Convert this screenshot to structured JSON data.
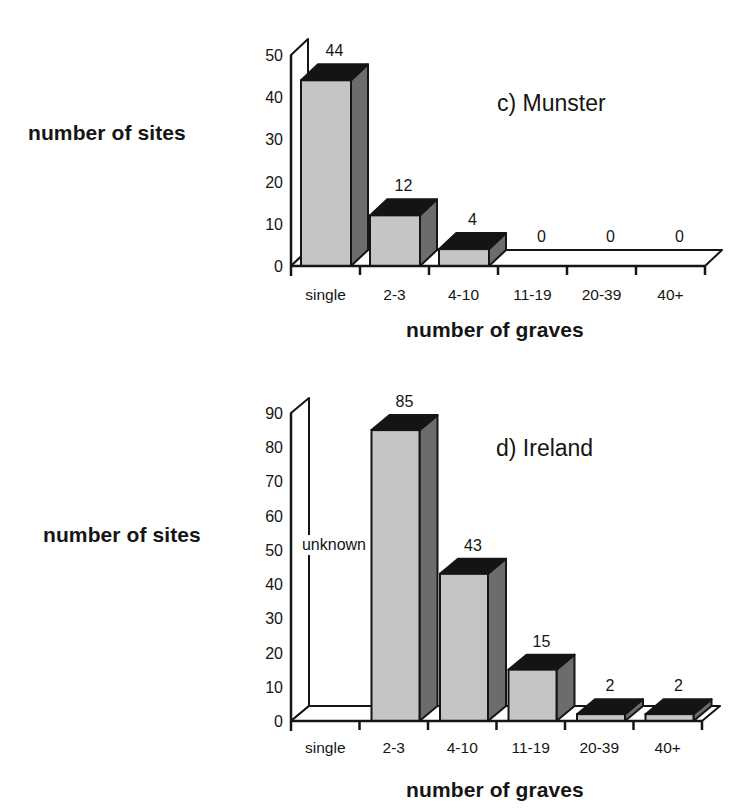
{
  "figure": {
    "panels": [
      {
        "id": "c",
        "title": "c) Munster",
        "ylabel": "number of sites",
        "xlabel": "number of graves"
      },
      {
        "id": "d",
        "title": "d) Ireland",
        "ylabel": "number of sites",
        "xlabel": "number of graves"
      }
    ]
  },
  "chart_data": [
    {
      "type": "bar",
      "style": "3d",
      "title": "c) Munster",
      "xlabel": "number of graves",
      "ylabel": "number of sites",
      "categories": [
        "single",
        "2-3",
        "4-10",
        "11-19",
        "20-39",
        "40+"
      ],
      "values": [
        44,
        12,
        4,
        0,
        0,
        0
      ],
      "data_labels": [
        "44",
        "12",
        "4",
        "0",
        "0",
        "0"
      ],
      "yticks": [
        0,
        10,
        20,
        30,
        40,
        50
      ],
      "ytick_labels": [
        "0",
        "10",
        "20",
        "30",
        "40",
        "50"
      ],
      "ylim": [
        0,
        50
      ],
      "grid": false,
      "legend": null,
      "colors": {
        "front": "#c5c5c5",
        "side": "#6c6c6c",
        "top": "#141414",
        "line": "#151515",
        "wall": "#ffffff"
      }
    },
    {
      "type": "bar",
      "style": "3d",
      "title": "d) Ireland",
      "xlabel": "number of graves",
      "ylabel": "number of sites",
      "categories": [
        "single",
        "2-3",
        "4-10",
        "11-19",
        "20-39",
        "40+"
      ],
      "values": [
        null,
        85,
        43,
        15,
        2,
        2
      ],
      "data_labels": [
        "unknown",
        "85",
        "43",
        "15",
        "2",
        "2"
      ],
      "annotations": [
        {
          "category": "single",
          "text": "unknown"
        }
      ],
      "yticks": [
        0,
        10,
        20,
        30,
        40,
        50,
        60,
        70,
        80,
        90
      ],
      "ytick_labels": [
        "0",
        "10",
        "20",
        "30",
        "40",
        "50",
        "60",
        "70",
        "80",
        "90"
      ],
      "ylim": [
        0,
        90
      ],
      "grid": false,
      "legend": null,
      "colors": {
        "front": "#c5c5c5",
        "side": "#6c6c6c",
        "top": "#141414",
        "line": "#151515",
        "wall": "#ffffff"
      }
    }
  ]
}
